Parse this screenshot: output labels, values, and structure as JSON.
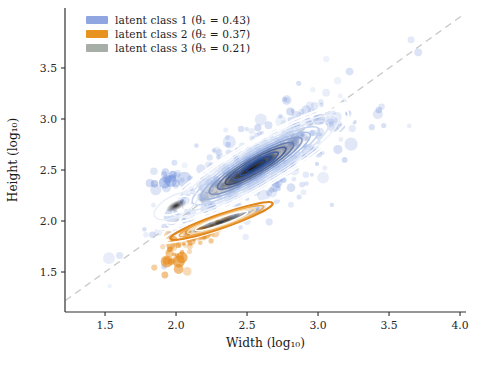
{
  "chart_data": {
    "type": "scatter",
    "title": "",
    "xlabel": "Width (log₁₀)",
    "ylabel": "Height (log₁₀)",
    "xlim": [
      1.218,
      4.042
    ],
    "ylim": [
      1.108,
      4.088
    ],
    "xticks": [
      1.5,
      2.0,
      2.5,
      3.0,
      3.5,
      4.0
    ],
    "yticks": [
      1.5,
      2.0,
      2.5,
      3.0,
      3.5
    ],
    "grid": false,
    "spine_color": "#2e2e2e",
    "legend": {
      "position": "upper-left",
      "entries": [
        {
          "label": "latent class 1 (θ₁ = 0.43)",
          "theta": 0.43,
          "color": "#8fa6e0"
        },
        {
          "label": "latent class 2 (θ₂ = 0.37)",
          "theta": 0.37,
          "color": "#e8921f"
        },
        {
          "label": "latent class 3 (θ₃ = 0.21)",
          "theta": 0.21,
          "color": "#a7aea7"
        }
      ]
    },
    "identity_line": {
      "from": [
        1.22,
        1.22
      ],
      "to": [
        4.02,
        4.02
      ],
      "style": "dashed",
      "color": "#c6c6c6",
      "width": 1.3,
      "dash": "7 5"
    },
    "series": [
      {
        "name": "latent class 1 cloud",
        "class": 1,
        "color": "#6f90da",
        "opacity": 0.22,
        "n": 440,
        "center": [
          2.58,
          2.56
        ],
        "angle_deg": 45,
        "sigma_along": 0.46,
        "sigma_perp": 0.175,
        "r_base": 2.0,
        "r_var": 1.6,
        "r_max": 9
      },
      {
        "name": "latent class 1 left knot",
        "class": 1,
        "color": "#6f90da",
        "opacity": 0.34,
        "n": 16,
        "center": [
          1.94,
          2.4
        ],
        "angle_deg": 45,
        "sigma_along": 0.11,
        "sigma_perp": 0.07,
        "r_base": 3.0,
        "r_var": 1.8,
        "r_max": 7.5
      },
      {
        "name": "latent class 2 cluster",
        "class": 2,
        "color": "#e68a19",
        "opacity": 0.4,
        "n": 60,
        "center": [
          2.13,
          1.82
        ],
        "angle_deg": 40,
        "sigma_along": 0.155,
        "sigma_perp": 0.05,
        "r_base": 1.8,
        "r_var": 1.2,
        "r_max": 4.5
      },
      {
        "name": "latent class 2 tail",
        "class": 2,
        "color": "#e68a19",
        "opacity": 0.5,
        "n": 12,
        "center": [
          1.96,
          1.62
        ],
        "angle_deg": 55,
        "sigma_along": 0.08,
        "sigma_perp": 0.05,
        "r_base": 2.5,
        "r_var": 1.5,
        "r_max": 6
      }
    ],
    "contours": [
      {
        "kind": "rings",
        "name": "class-1 outer contours",
        "center": [
          2.56,
          2.54
        ],
        "angle_deg": 40,
        "aspect": 0.22,
        "rings": [
          {
            "a": 0.93,
            "color": "#ffffff",
            "w": 2.2
          },
          {
            "a": 0.84,
            "color": "#ffffff",
            "w": 2.0
          },
          {
            "a": 0.75,
            "color": "#eef3fb",
            "w": 1.6
          },
          {
            "a": 0.66,
            "color": "#dbe5f6",
            "w": 1.6
          },
          {
            "a": 0.575,
            "color": "#c4d3ef",
            "w": 1.6
          },
          {
            "a": 0.495,
            "color": "#aabfe7",
            "w": 1.6
          },
          {
            "a": 0.42,
            "color": "#8fa9dd",
            "w": 1.6
          },
          {
            "a": 0.345,
            "color": "#7292d0",
            "w": 1.6
          },
          {
            "a": 0.275,
            "color": "#5578bf",
            "w": 1.6
          }
        ]
      },
      {
        "kind": "smudge",
        "name": "class-3 main density",
        "center": [
          2.54,
          2.52
        ],
        "angle_deg": 40,
        "a": 0.52,
        "b": 0.1,
        "color": "#26262c",
        "opacity": 0.72
      },
      {
        "kind": "smudge",
        "name": "class-3 main density core",
        "center": [
          2.52,
          2.5
        ],
        "angle_deg": 40,
        "a": 0.28,
        "b": 0.055,
        "color": "#111114",
        "opacity": 0.85
      },
      {
        "kind": "rings",
        "name": "class-1 inner contours",
        "center": [
          2.56,
          2.54
        ],
        "angle_deg": 40,
        "aspect": 0.22,
        "rings": [
          {
            "a": 0.205,
            "color": "#3e60a8",
            "w": 1.6
          },
          {
            "a": 0.14,
            "color": "#2c4c90",
            "w": 1.6
          },
          {
            "a": 0.085,
            "color": "#1f3c78",
            "w": 1.6
          }
        ]
      },
      {
        "kind": "smudge",
        "name": "class-3 small mode",
        "center": [
          2.0,
          2.15
        ],
        "angle_deg": 40,
        "a": 0.085,
        "b": 0.042,
        "color": "#101014",
        "opacity": 0.92
      },
      {
        "kind": "rings",
        "name": "small mode halo",
        "center": [
          2.0,
          2.15
        ],
        "angle_deg": 40,
        "aspect": 0.5,
        "rings": [
          {
            "a": 0.185,
            "color": "#e8eef8",
            "w": 1.4
          },
          {
            "a": 0.125,
            "color": "#ffffff",
            "w": 1.8
          }
        ]
      },
      {
        "kind": "smudge",
        "name": "class-3 lower mode",
        "center": [
          2.32,
          1.99
        ],
        "angle_deg": 26,
        "a": 0.3,
        "b": 0.042,
        "color": "#171410",
        "opacity": 0.85
      },
      {
        "kind": "rings",
        "name": "class-2 contours",
        "center": [
          2.32,
          2.0
        ],
        "angle_deg": 26,
        "aspect": 0.16,
        "rings": [
          {
            "a": 0.47,
            "color": "#ffffff",
            "w": 1.8
          },
          {
            "a": 0.4,
            "color": "#e0861c",
            "w": 2.2
          },
          {
            "a": 0.33,
            "color": "#eda84e",
            "w": 1.6
          },
          {
            "a": 0.265,
            "color": "#f8dcae",
            "w": 1.5
          },
          {
            "a": 0.205,
            "color": "#ffffff",
            "w": 1.5
          }
        ]
      }
    ]
  }
}
